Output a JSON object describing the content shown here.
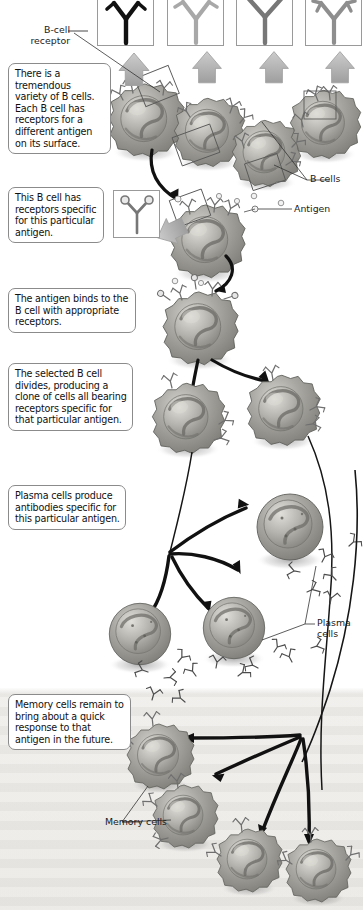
{
  "figure": {
    "type": "biology-process-diagram"
  },
  "callouts": [
    {
      "id": "variety",
      "text": "There is a tremendous variety of B cells. Each B cell has receptors for a different antigen on its surface."
    },
    {
      "id": "specific",
      "text": "This B cell has receptors specific for this particular antigen."
    },
    {
      "id": "binds",
      "text": "The antigen binds to the B cell with appropriate receptors."
    },
    {
      "id": "divides",
      "text": "The selected B cell divides, producing a clone of cells all bearing receptors specific for that particular antigen."
    },
    {
      "id": "plasma",
      "text": "Plasma cells produce antibodies specific for this particular antigen."
    },
    {
      "id": "memory",
      "text": "Memory cells remain to bring about a quick response to that antigen in the future."
    }
  ],
  "labels": [
    {
      "id": "bcell-receptor",
      "text": "B-cell\nreceptor"
    },
    {
      "id": "b-cells",
      "text": "B cells"
    },
    {
      "id": "antigen",
      "text": "Antigen"
    },
    {
      "id": "plasma-cells",
      "text": "Plasma\ncells"
    },
    {
      "id": "memory-cells",
      "text": "Memory cells"
    }
  ],
  "antibody_boxes": [
    {
      "id": "ab-1",
      "variant": "dark-hooked",
      "color": "#111111"
    },
    {
      "id": "ab-2",
      "variant": "light-hooked",
      "color": "#a8a8a8"
    },
    {
      "id": "ab-3",
      "variant": "plain-y",
      "color": "#777777"
    },
    {
      "id": "ab-4",
      "variant": "double-hook",
      "color": "#8e8e8e"
    }
  ],
  "colors": {
    "page_background": "#ffffff",
    "callout_border": "#8b8b8b",
    "callout_text": "#111111",
    "cell_body": "#9d9d99",
    "cell_nucleus": "#b9b8b2",
    "arrow_dark": "#151515",
    "arrow_grey": "#b6b6b6",
    "memory_band": "#eceae6",
    "receptor_stroke": "#6f6f6f"
  },
  "stages": [
    {
      "id": "stage-variety",
      "label": "Variety of B cells",
      "cell_count": 4
    },
    {
      "id": "stage-selected",
      "label": "Selected B cell",
      "cell_count": 1
    },
    {
      "id": "stage-bound",
      "label": "Antigen bound",
      "cell_count": 1
    },
    {
      "id": "stage-clone",
      "label": "Clone of B cells",
      "cell_count": 2
    },
    {
      "id": "stage-plasma",
      "label": "Plasma cells",
      "cell_count": 3
    },
    {
      "id": "stage-memory",
      "label": "Memory cells",
      "cell_count": 4
    }
  ]
}
